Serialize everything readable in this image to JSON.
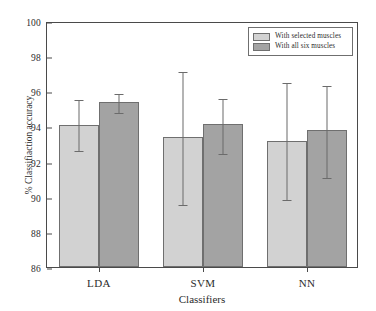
{
  "chart_data": {
    "type": "bar",
    "title": "",
    "xlabel": "Classifiers",
    "ylabel": "% Classifiaction accuracy",
    "categories": [
      "LDA",
      "SVM",
      "NN"
    ],
    "ylim": [
      86,
      100
    ],
    "yticks": [
      86,
      88,
      90,
      92,
      94,
      96,
      98,
      100
    ],
    "grid": false,
    "legend_position": "top-right",
    "series": [
      {
        "name": "With selected muscles",
        "color": "#d2d2d2",
        "values": [
          94.1,
          93.4,
          93.2
        ],
        "err_low": [
          92.7,
          89.65,
          89.9
        ],
        "err_high": [
          95.6,
          97.2,
          96.6
        ]
      },
      {
        "name": "With all six muscles",
        "color": "#a3a3a3",
        "values": [
          95.4,
          94.15,
          93.8
        ],
        "err_low": [
          94.85,
          92.55,
          91.2
        ],
        "err_high": [
          95.95,
          95.7,
          96.4
        ]
      }
    ]
  }
}
